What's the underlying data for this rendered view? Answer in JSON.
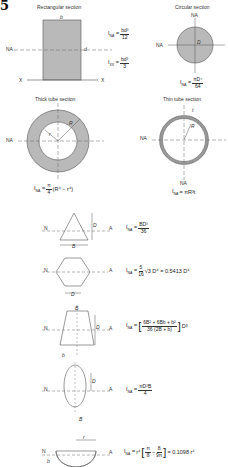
{
  "page": {
    "chapter_fragment": "5"
  },
  "sections": {
    "rectangular": {
      "title": "Rectangular section",
      "labels": {
        "b": "b",
        "d": "d",
        "na": "NA",
        "x_left": "X",
        "x_right": "X"
      },
      "formula_na": {
        "lhs": "I",
        "lhs_sub": "NA",
        "num": "bd³",
        "den": "12"
      },
      "formula_xx": {
        "lhs": "I",
        "lhs_sub": "XX",
        "num": "bd³",
        "den": "3"
      }
    },
    "circular": {
      "title": "Circular section",
      "labels": {
        "na_top": "NA",
        "na_left": "NA",
        "D": "D"
      },
      "formula": {
        "lhs": "I",
        "lhs_sub": "NA",
        "num": "πD⁴",
        "den": "64"
      }
    },
    "thick_tube": {
      "title": "Thick tube section",
      "labels": {
        "na": "NA",
        "r": "r",
        "R": "R"
      },
      "formula": {
        "lhs": "I",
        "lhs_sub": "NA",
        "pre_num": "π",
        "pre_den": "4",
        "rest": "(R⁴ − r⁴)"
      }
    },
    "thin_tube": {
      "title": "Thin tube section",
      "labels": {
        "na_left": "NA",
        "na_bottom": "NA",
        "t": "t",
        "R": "R"
      },
      "formula": {
        "lhs": "I",
        "lhs_sub": "NA",
        "rhs": "= πR³t"
      }
    },
    "triangle": {
      "labels": {
        "N": "N",
        "A": "A",
        "D": "D",
        "B": "B"
      },
      "formula": {
        "lhs": "I",
        "lhs_sub": "NA",
        "num": "BD³",
        "den": "36"
      }
    },
    "hexagon": {
      "labels": {
        "N": "N",
        "A": "A",
        "D": "D"
      },
      "formula": {
        "lhs": "I",
        "lhs_sub": "NA",
        "num": "5",
        "den": "16",
        "rest": "√3 D⁴ = 0.5413 D⁴"
      }
    },
    "trapezoid": {
      "labels": {
        "N": "N",
        "A": "A",
        "B": "B",
        "b": "b",
        "D": "D"
      },
      "formula": {
        "lhs": "I",
        "lhs_sub": "NA",
        "num": "6B² + 6Bb + b²",
        "den": "36 (2B + b)",
        "rest": "D³"
      }
    },
    "ellipse": {
      "labels": {
        "N": "N",
        "A": "A",
        "D": "D",
        "B": "B"
      },
      "formula": {
        "lhs": "I",
        "lhs_sub": "NA",
        "num": "πD³B",
        "den": "4"
      }
    },
    "semicircle": {
      "labels": {
        "N": "N",
        "A": "A",
        "r": "r",
        "b": "b"
      },
      "formula": {
        "lhs": "I",
        "lhs_sub": "NA",
        "pre": "r⁴",
        "a_num": "π",
        "a_den": "8",
        "b_num": "8",
        "b_den": "9π",
        "rest": "= 0.1098 r⁴"
      }
    }
  },
  "colors": {
    "fill_gray": "#b9b9b9",
    "line": "#555555",
    "text": "#222222"
  }
}
